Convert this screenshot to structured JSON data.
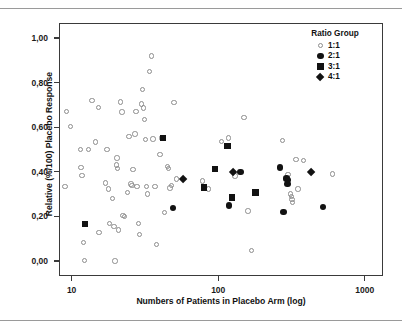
{
  "figure": {
    "name": "placebo-response-scatter",
    "background": "#ffffff",
    "frame_color": "#3a3a3a"
  },
  "colors": {
    "open_marker_stroke": "#8d8d8d",
    "filled_marker": "#121212",
    "axis": "#3a3a3a",
    "text": "#1a1a1a",
    "page_rule": "#9a9a9a"
  },
  "axes": {
    "x": {
      "label": "Numbers of Patients in Placebo Arm (log)",
      "scale": "log",
      "ticks": [
        10,
        100,
        1000
      ],
      "tick_labels": [
        "10",
        "100",
        "1000"
      ],
      "range": [
        8.2,
        1330
      ]
    },
    "y": {
      "label": "Relative (%/100) Placebo Response",
      "scale": "linear",
      "ticks": [
        0,
        0.2,
        0.4,
        0.6,
        0.8,
        1.0
      ],
      "tick_labels": [
        "0,00",
        "0,20",
        "0,40",
        "0,60",
        "0,80",
        "1,00"
      ],
      "range": [
        -0.068,
        1.068
      ]
    }
  },
  "legend": {
    "title": "Ratio Group",
    "position": "top-right",
    "entries": [
      {
        "label": "1:1",
        "marker": "circle-open",
        "icon": "open-circle-icon"
      },
      {
        "label": "2:1",
        "marker": "circle-filled",
        "icon": "filled-circle-icon"
      },
      {
        "label": "3:1",
        "marker": "square-filled",
        "icon": "filled-square-icon"
      },
      {
        "label": "4:1",
        "marker": "diamond-filled",
        "icon": "filled-diamond-icon"
      }
    ]
  },
  "chart_data": {
    "type": "scatter",
    "title": "",
    "xlabel": "Numbers of Patients in Placebo Arm (log)",
    "ylabel": "Relative (%/100) Placebo Response",
    "xscale": "log",
    "yscale": "linear",
    "xlim": [
      8.2,
      1330
    ],
    "ylim": [
      -0.068,
      1.068
    ],
    "xticks": [
      10,
      100,
      1000
    ],
    "yticks": [
      0,
      0.2,
      0.4,
      0.6,
      0.8,
      1.0
    ],
    "grid": false,
    "legend_title": "Ratio Group",
    "legend_position": "top-right",
    "series": [
      {
        "name": "1:1",
        "marker": "circle-open",
        "points": [
          [
            9.2,
            0.67
          ],
          [
            9.0,
            0.334
          ],
          [
            9.8,
            0.602
          ],
          [
            11.5,
            0.5
          ],
          [
            11.6,
            0.42
          ],
          [
            11.8,
            0.384
          ],
          [
            12.0,
            0.082
          ],
          [
            12.2,
            0.002
          ],
          [
            13.0,
            0.5
          ],
          [
            13.8,
            0.719
          ],
          [
            14.6,
            0.534
          ],
          [
            15.2,
            0.689
          ],
          [
            15.4,
            0.127
          ],
          [
            17.0,
            0.35
          ],
          [
            17.4,
            0.499
          ],
          [
            17.8,
            0.322
          ],
          [
            18.2,
            0.168
          ],
          [
            19.0,
            0.281
          ],
          [
            19.4,
            0.155
          ],
          [
            19.8,
            0.0
          ],
          [
            20.2,
            0.43
          ],
          [
            20.4,
            0.462
          ],
          [
            20.6,
            0.415
          ],
          [
            20.8,
            0.139
          ],
          [
            21.5,
            0.713
          ],
          [
            22.0,
            0.668
          ],
          [
            22.4,
            0.204
          ],
          [
            23.0,
            0.2
          ],
          [
            24.0,
            0.308
          ],
          [
            24.6,
            0.559
          ],
          [
            25.4,
            0.345
          ],
          [
            25.8,
            0.338
          ],
          [
            26.2,
            0.411
          ],
          [
            27.0,
            0.57
          ],
          [
            27.4,
            0.67
          ],
          [
            28.0,
            0.334
          ],
          [
            28.6,
            0.168
          ],
          [
            29.0,
            0.118
          ],
          [
            30.0,
            0.704
          ],
          [
            30.5,
            0.77
          ],
          [
            31.0,
            0.686
          ],
          [
            31.5,
            0.636
          ],
          [
            32.0,
            0.545
          ],
          [
            32.5,
            0.334
          ],
          [
            33.0,
            0.301
          ],
          [
            34.0,
            0.85
          ],
          [
            35.0,
            0.92
          ],
          [
            36.0,
            0.547
          ],
          [
            37.0,
            0.334
          ],
          [
            38.0,
            0.074
          ],
          [
            40.0,
            0.478
          ],
          [
            41.0,
            0.552
          ],
          [
            43.0,
            0.218
          ],
          [
            45.0,
            0.423
          ],
          [
            46.0,
            0.414
          ],
          [
            47.0,
            0.327
          ],
          [
            48.0,
            0.338
          ],
          [
            50.0,
            0.711
          ],
          [
            52.0,
            0.368
          ],
          [
            78.0,
            0.359
          ],
          [
            86.0,
            0.322
          ],
          [
            105.0,
            0.536
          ],
          [
            118.0,
            0.552
          ],
          [
            130.0,
            0.381
          ],
          [
            150.0,
            0.644
          ],
          [
            160.0,
            0.224
          ],
          [
            168.0,
            0.046
          ],
          [
            275.0,
            0.54
          ],
          [
            300.0,
            0.388
          ],
          [
            310.0,
            0.3
          ],
          [
            315.0,
            0.288
          ],
          [
            318.0,
            0.275
          ],
          [
            322.0,
            0.262
          ],
          [
            340.0,
            0.456
          ],
          [
            350.0,
            0.322
          ],
          [
            380.0,
            0.45
          ],
          [
            600.0,
            0.39
          ]
        ]
      },
      {
        "name": "2:1",
        "marker": "circle-filled",
        "points": [
          [
            49.0,
            0.236
          ],
          [
            118.0,
            0.248
          ],
          [
            142.0,
            0.4
          ],
          [
            265.0,
            0.42
          ],
          [
            278.0,
            0.22
          ],
          [
            292.0,
            0.37
          ],
          [
            296.0,
            0.345
          ],
          [
            300.0,
            0.362
          ],
          [
            520.0,
            0.241
          ]
        ]
      },
      {
        "name": "3:1",
        "marker": "square-filled",
        "points": [
          [
            12.3,
            0.166
          ],
          [
            42.0,
            0.551
          ],
          [
            80.0,
            0.33
          ],
          [
            95.0,
            0.412
          ],
          [
            116.0,
            0.516
          ],
          [
            124.0,
            0.285
          ],
          [
            180.0,
            0.306
          ]
        ]
      },
      {
        "name": "4:1",
        "marker": "diamond-filled",
        "points": [
          [
            58.0,
            0.368
          ],
          [
            126.0,
            0.4
          ],
          [
            430.0,
            0.398
          ]
        ]
      }
    ]
  }
}
